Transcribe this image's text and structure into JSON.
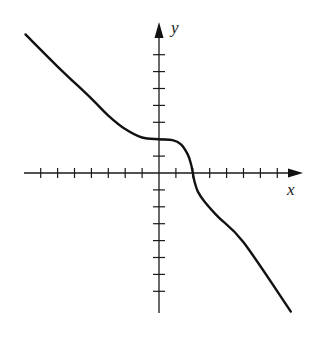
{
  "chart_data": {
    "type": "line",
    "title": "",
    "xlabel": "x",
    "ylabel": "y",
    "xlim": [
      -8,
      8.5
    ],
    "ylim": [
      -8,
      9
    ],
    "grid": false,
    "legend": null,
    "x_ticks_count_each_side": 7,
    "y_ticks_count_each_side": 7,
    "tick_spacing_units": 1,
    "series": [
      {
        "name": "curve",
        "color": "#111111",
        "points": [
          [
            -7.9,
            8.2
          ],
          [
            -6,
            6.3
          ],
          [
            -4,
            4.4
          ],
          [
            -3,
            3.4
          ],
          [
            -2,
            2.6
          ],
          [
            -1,
            2.1
          ],
          [
            0,
            2.0
          ],
          [
            0.8,
            1.95
          ],
          [
            1.3,
            1.7
          ],
          [
            1.7,
            1.1
          ],
          [
            1.9,
            0.5
          ],
          [
            2.0,
            0.0
          ],
          [
            2.1,
            -0.5
          ],
          [
            2.3,
            -1.1
          ],
          [
            2.7,
            -1.7
          ],
          [
            3.5,
            -2.6
          ],
          [
            5,
            -4.1
          ],
          [
            7.8,
            -8.2
          ]
        ]
      }
    ],
    "annotations": [
      {
        "text": "horizontal tangent near",
        "at": [
          0,
          2
        ]
      },
      {
        "text": "vertical tangent at",
        "at": [
          2,
          0
        ]
      }
    ]
  },
  "labels": {
    "x_axis": "x",
    "y_axis": "y"
  }
}
